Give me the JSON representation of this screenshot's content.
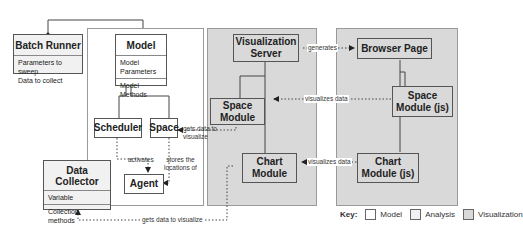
{
  "boxes": {
    "batch_runner": {
      "title": "Batch Runner",
      "attributes": [
        "Parameters to sweep",
        "Data to collect"
      ]
    },
    "model": {
      "title": "Model",
      "attributes": [
        "Model",
        "Parameters"
      ],
      "methods": "Model Methods"
    },
    "scheduler": {
      "title": "Scheduler"
    },
    "space": {
      "title": "Space"
    },
    "agent": {
      "title": "Agent"
    },
    "data_collector": {
      "title": "Data Collector",
      "attributes": "Variable",
      "methods": [
        "Collection",
        "methods"
      ]
    },
    "visualization_server": {
      "title": [
        "Visualization",
        "Server"
      ]
    },
    "space_module": {
      "title": [
        "Space",
        "Module"
      ]
    },
    "chart_module": {
      "title": [
        "Chart",
        "Module"
      ]
    },
    "browser_page": {
      "title": "Browser Page"
    },
    "space_module_js": {
      "title": [
        "Space",
        "Module (js)"
      ]
    },
    "chart_module_js": {
      "title": [
        "Chart",
        "Module (js)"
      ]
    }
  },
  "edge_labels": {
    "activates": "activates",
    "stores_locations": [
      "stores the",
      "locations of"
    ],
    "gets_data_space": [
      "gets data to",
      "visualize"
    ],
    "generates": "generates",
    "visualizes_data_space": "visualizes data",
    "visualizes_data_chart": "visualizes data",
    "gets_data_chart": "gets data to visualize"
  },
  "key": {
    "label": "Key:",
    "items": [
      {
        "label": "Model",
        "color": "#ffffff"
      },
      {
        "label": "Analysis",
        "color": "#f1f1f1"
      },
      {
        "label": "Visualization",
        "color": "#d9d9d9"
      }
    ]
  }
}
